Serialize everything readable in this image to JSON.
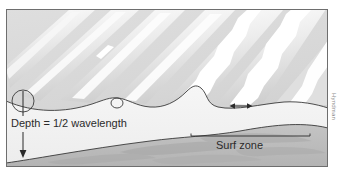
{
  "figure": {
    "type": "oceanography-wave-diagram",
    "title_visible": false,
    "labels": {
      "depth": "Depth = 1/2 wavelength",
      "surf_zone": "Surf zone",
      "credit": "Hyndman"
    },
    "colors": {
      "background": "#ffffff",
      "panel_sky_water": "#d8d8d8",
      "water_light": "#e9e9e9",
      "foam_white": "#ffffff",
      "cross_section_water": "#f2f2f2",
      "seabed": "#bdbdbd",
      "seabed_dark": "#ababab",
      "line": "#3a3a3a",
      "border": "#6e6e6e",
      "text": "#2b2b2b"
    },
    "panel": {
      "x": 6,
      "y": 9,
      "width": 322,
      "height": 158
    },
    "annotations": {
      "depth_arrow": {
        "name": "depth-arrow",
        "x": 23,
        "y_top": 103,
        "y_bottom": 156,
        "direction": "down"
      },
      "surf_bracket": {
        "name": "surf-zone-bracket",
        "x_start": 191,
        "x_end": 310,
        "y": 136
      },
      "orbital_motion_arrow": {
        "name": "orbital-flat-arrow",
        "x_start": 230,
        "x_end": 251,
        "y": 106,
        "direction": "both"
      },
      "orbits": [
        {
          "name": "deep-water-orbit-circle",
          "cx": 23,
          "cy": 101,
          "rx": 11,
          "ry": 11
        },
        {
          "name": "shoaling-orbit-ellipse",
          "cx": 117,
          "cy": 103,
          "rx": 6,
          "ry": 5
        }
      ]
    },
    "wave_crests": {
      "count": 7,
      "orientation": "diagonal-lower-left-to-upper-right",
      "breaking_side": "right"
    },
    "surface_profile": {
      "description": "wave surface in cross-section, steepening and breaking toward shore"
    },
    "seafloor": {
      "description": "sloping bottom rising from lower-left to right"
    }
  }
}
